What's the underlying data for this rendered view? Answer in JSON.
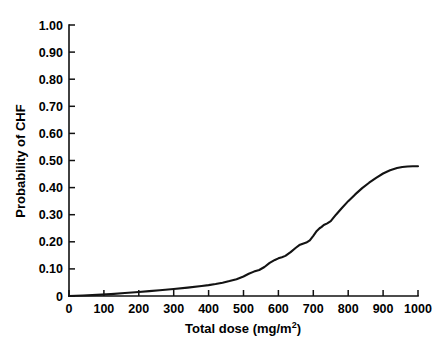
{
  "chart_data": {
    "type": "line",
    "title": "",
    "xlabel": "Total dose (mg/m2)",
    "xlabel_base": "Total dose (mg/m",
    "xlabel_sup": "2",
    "xlabel_close": ")",
    "ylabel": "Probability of CHF",
    "xlim": [
      0,
      1000
    ],
    "ylim": [
      0,
      1.0
    ],
    "grid": false,
    "legend": "none",
    "xticks": [
      0,
      100,
      200,
      300,
      400,
      500,
      600,
      700,
      800,
      900,
      1000
    ],
    "xtick_labels": [
      "0",
      "100",
      "200",
      "300",
      "400",
      "500",
      "600",
      "700",
      "800",
      "900",
      "1000"
    ],
    "yticks": [
      0,
      0.1,
      0.2,
      0.3,
      0.4,
      0.5,
      0.6,
      0.7,
      0.8,
      0.9,
      1.0
    ],
    "ytick_labels": [
      "0",
      "0.10",
      "0.20",
      "0.30",
      "0.40",
      "0.50",
      "0.60",
      "0.70",
      "0.80",
      "0.90",
      "1.00"
    ],
    "series": [
      {
        "name": "Cumulative probability of CHF",
        "color": "#131313",
        "x": [
          0,
          40,
          80,
          120,
          160,
          200,
          230,
          260,
          300,
          340,
          380,
          400,
          420,
          440,
          460,
          480,
          500,
          515,
          530,
          545,
          560,
          575,
          590,
          600,
          610,
          620,
          635,
          650,
          660,
          670,
          680,
          690,
          700,
          710,
          718,
          724,
          730,
          740,
          750,
          765,
          780,
          800,
          820,
          840,
          860,
          880,
          900,
          920,
          940,
          955,
          970,
          985,
          1000
        ],
        "y": [
          0.0,
          0.002,
          0.004,
          0.007,
          0.011,
          0.015,
          0.018,
          0.021,
          0.026,
          0.031,
          0.037,
          0.04,
          0.044,
          0.049,
          0.055,
          0.062,
          0.072,
          0.082,
          0.09,
          0.096,
          0.107,
          0.122,
          0.133,
          0.139,
          0.143,
          0.148,
          0.162,
          0.178,
          0.188,
          0.193,
          0.197,
          0.205,
          0.222,
          0.24,
          0.25,
          0.255,
          0.262,
          0.268,
          0.276,
          0.3,
          0.322,
          0.35,
          0.375,
          0.398,
          0.418,
          0.436,
          0.452,
          0.464,
          0.472,
          0.476,
          0.478,
          0.479,
          0.479
        ]
      }
    ]
  },
  "axes": {
    "x_title_text": "Total dose (mg/m",
    "x_title_sup": "2",
    "x_title_tail": ")",
    "y_title_text": "Probability of CHF"
  }
}
